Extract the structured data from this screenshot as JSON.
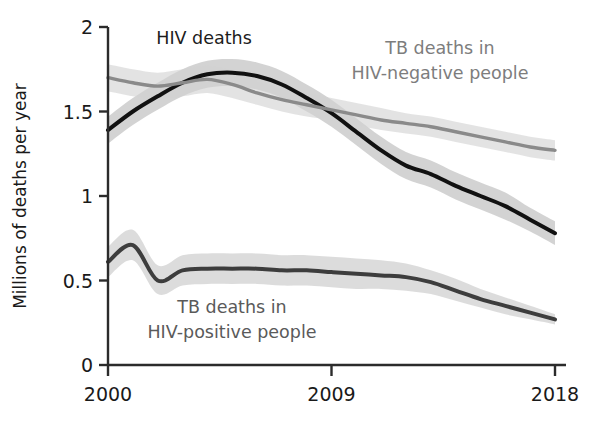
{
  "chart_data": {
    "type": "line",
    "title": "",
    "xlabel": "",
    "ylabel": "Millions of deaths per year",
    "xlim": [
      2000,
      2018
    ],
    "ylim": [
      0,
      2
    ],
    "grid": false,
    "legend_position": "inline-annotations",
    "x": [
      2000,
      2001,
      2002,
      2003,
      2004,
      2005,
      2006,
      2007,
      2008,
      2009,
      2010,
      2011,
      2012,
      2013,
      2014,
      2015,
      2016,
      2017,
      2018
    ],
    "xticks": [
      "2000",
      "2009",
      "2018"
    ],
    "xtick_values": [
      2000,
      2009,
      2018
    ],
    "yticks": [
      "0",
      "0.5",
      "1",
      "1.5",
      "2"
    ],
    "ytick_values": [
      0,
      0.5,
      1,
      1.5,
      2
    ],
    "series": [
      {
        "name": "HIV deaths",
        "color": "#111111",
        "band_color": "#b8b8b8",
        "label_color": "#1c1c1c",
        "values": [
          1.39,
          1.5,
          1.59,
          1.67,
          1.72,
          1.73,
          1.71,
          1.66,
          1.58,
          1.49,
          1.38,
          1.27,
          1.18,
          1.13,
          1.06,
          1.0,
          0.94,
          0.86,
          0.78
        ],
        "lower": [
          1.31,
          1.42,
          1.51,
          1.59,
          1.64,
          1.65,
          1.63,
          1.58,
          1.5,
          1.41,
          1.3,
          1.19,
          1.1,
          1.05,
          0.98,
          0.92,
          0.86,
          0.79,
          0.71
        ],
        "upper": [
          1.47,
          1.58,
          1.67,
          1.75,
          1.8,
          1.81,
          1.79,
          1.74,
          1.66,
          1.57,
          1.46,
          1.35,
          1.26,
          1.21,
          1.14,
          1.08,
          1.02,
          0.93,
          0.85
        ]
      },
      {
        "name": "TB deaths in HIV-negative people",
        "color": "#8a8a8a",
        "band_color": "#d2d2d2",
        "label_color": "#7d7d7d",
        "values": [
          1.7,
          1.67,
          1.65,
          1.67,
          1.69,
          1.66,
          1.61,
          1.57,
          1.54,
          1.51,
          1.48,
          1.45,
          1.43,
          1.41,
          1.38,
          1.35,
          1.32,
          1.29,
          1.27
        ],
        "lower": [
          1.62,
          1.59,
          1.57,
          1.59,
          1.61,
          1.58,
          1.54,
          1.5,
          1.47,
          1.45,
          1.42,
          1.39,
          1.37,
          1.35,
          1.32,
          1.29,
          1.26,
          1.23,
          1.21
        ],
        "upper": [
          1.78,
          1.75,
          1.73,
          1.75,
          1.77,
          1.74,
          1.68,
          1.64,
          1.61,
          1.58,
          1.55,
          1.52,
          1.49,
          1.47,
          1.44,
          1.41,
          1.38,
          1.35,
          1.33
        ]
      },
      {
        "name": "TB deaths in HIV-positive people",
        "color": "#3d3d3d",
        "band_color": "#c6c6c6",
        "label_color": "#5a5a5a",
        "values": [
          0.61,
          0.71,
          0.5,
          0.56,
          0.57,
          0.57,
          0.57,
          0.56,
          0.56,
          0.55,
          0.54,
          0.53,
          0.52,
          0.49,
          0.44,
          0.39,
          0.35,
          0.31,
          0.27
        ],
        "lower": [
          0.52,
          0.62,
          0.42,
          0.47,
          0.48,
          0.48,
          0.48,
          0.47,
          0.47,
          0.46,
          0.45,
          0.45,
          0.44,
          0.42,
          0.38,
          0.34,
          0.3,
          0.27,
          0.24
        ],
        "upper": [
          0.7,
          0.8,
          0.59,
          0.65,
          0.66,
          0.66,
          0.66,
          0.65,
          0.65,
          0.64,
          0.63,
          0.62,
          0.6,
          0.56,
          0.51,
          0.45,
          0.4,
          0.35,
          0.3
        ]
      }
    ],
    "annotations": [
      {
        "text": "HIV deaths",
        "x": 204,
        "y": 44,
        "color": "#1c1c1c",
        "anchor": "middle"
      },
      {
        "text": "TB deaths in",
        "x": 440,
        "y": 54,
        "color": "#7d7d7d",
        "anchor": "middle"
      },
      {
        "text": "HIV-negative people",
        "x": 440,
        "y": 79,
        "color": "#7d7d7d",
        "anchor": "middle"
      },
      {
        "text": "TB deaths in",
        "x": 232,
        "y": 313,
        "color": "#5a5a5a",
        "anchor": "middle"
      },
      {
        "text": "HIV-positive people",
        "x": 232,
        "y": 338,
        "color": "#5a5a5a",
        "anchor": "middle"
      }
    ]
  },
  "axes": {
    "y_axis_title": "Millions of deaths per year",
    "y_tick_labels": [
      "2",
      "1.5",
      "1",
      "0.5",
      "0"
    ],
    "x_tick_labels": [
      "2000",
      "2009",
      "2018"
    ]
  },
  "colors": {
    "axis": "#2b2b2b",
    "background": "#ffffff",
    "hiv_line": "#111111",
    "tb_negative_line": "#8a8a8a",
    "tb_positive_line": "#3d3d3d"
  }
}
